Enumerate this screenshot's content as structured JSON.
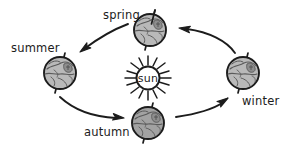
{
  "diagram": {
    "background_color": "#ffffff",
    "center_body": {
      "name": "sun",
      "label": "sun",
      "cx": 148,
      "cy": 78,
      "radius": 11,
      "ray_count": 16,
      "fill": "#ffffff",
      "stroke": "#1c1c1c"
    },
    "earths": [
      {
        "id": "spring",
        "label": "spring",
        "cx": 150,
        "cy": 30,
        "radius": 16,
        "fill": "#b9b9b9",
        "stroke": "#1c1c1c",
        "axis_tilt_deg": 20,
        "label_x": 103,
        "label_y": 19,
        "label_anchor": "start"
      },
      {
        "id": "summer",
        "label": "summer",
        "cx": 60,
        "cy": 73,
        "radius": 16,
        "fill": "#b9b9b9",
        "stroke": "#1c1c1c",
        "axis_tilt_deg": 20,
        "label_x": 11,
        "label_y": 52,
        "label_anchor": "start"
      },
      {
        "id": "autumn",
        "label": "autumn",
        "cx": 148,
        "cy": 123,
        "radius": 16,
        "fill": "#a2a2a2",
        "stroke": "#1c1c1c",
        "axis_tilt_deg": 20,
        "label_x": 84,
        "label_y": 136,
        "label_anchor": "start"
      },
      {
        "id": "winter",
        "label": "winter",
        "cx": 243,
        "cy": 73,
        "radius": 16,
        "fill": "#b9b9b9",
        "stroke": "#1c1c1c",
        "axis_tilt_deg": 20,
        "label_x": 242,
        "label_y": 105,
        "label_anchor": "start"
      }
    ],
    "arrows": [
      {
        "id": "spring-to-summer",
        "from": "spring",
        "to": "summer",
        "direction": "left",
        "path": "M 128 24 C 112 30 96 40 84 49",
        "head_x": 80,
        "head_y": 52,
        "head_angle_deg": 143
      },
      {
        "id": "summer-to-autumn",
        "from": "summer",
        "to": "autumn",
        "direction": "down-right",
        "path": "M 60 97 C 74 110 94 117 116 118",
        "head_x": 122,
        "head_y": 118,
        "head_angle_deg": 8
      },
      {
        "id": "autumn-to-winter",
        "from": "autumn",
        "to": "winter",
        "direction": "up-right",
        "path": "M 176 117 C 196 114 212 110 222 103",
        "head_x": 227,
        "head_y": 99,
        "head_angle_deg": -33
      },
      {
        "id": "winter-to-spring",
        "from": "winter",
        "to": "spring",
        "direction": "up-left",
        "path": "M 235 53 C 226 42 208 32 186 29",
        "head_x": 179,
        "head_y": 28,
        "head_angle_deg": 190
      }
    ],
    "colors": {
      "ink": "#1c1c1c",
      "globe_light": "#b9b9b9",
      "globe_dark": "#a2a2a2",
      "continent": "#6f6f6f",
      "background": "#ffffff"
    }
  }
}
